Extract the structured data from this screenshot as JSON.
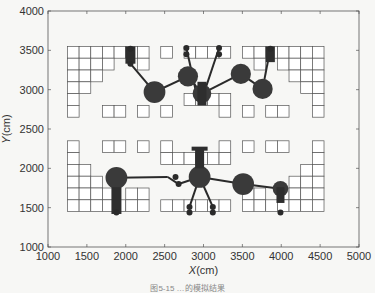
{
  "chart_data": {
    "type": "scatter",
    "title": "",
    "xlabel": "X(cm)",
    "ylabel": "Y(cm)",
    "xlim": [
      1000,
      5000
    ],
    "ylim": [
      1000,
      4000
    ],
    "xticks": [
      1000,
      1500,
      2000,
      2500,
      3000,
      3500,
      4000,
      4500,
      5000
    ],
    "yticks": [
      1000,
      1500,
      2000,
      2500,
      3000,
      3500,
      4000
    ],
    "grid": false,
    "legend": null,
    "cell_size_cm": 150,
    "cells_top": [
      [
        1250,
        3400
      ],
      [
        1400,
        3400
      ],
      [
        1550,
        3400
      ],
      [
        1700,
        3400
      ],
      [
        1850,
        3400
      ],
      [
        2000,
        3400
      ],
      [
        2150,
        3400
      ],
      [
        2450,
        3400
      ],
      [
        2750,
        3400
      ],
      [
        2900,
        3400
      ],
      [
        3050,
        3400
      ],
      [
        3200,
        3400
      ],
      [
        3500,
        3400
      ],
      [
        3650,
        3400
      ],
      [
        3800,
        3400
      ],
      [
        3950,
        3400
      ],
      [
        4100,
        3400
      ],
      [
        4250,
        3400
      ],
      [
        4400,
        3400
      ],
      [
        1250,
        3250
      ],
      [
        1400,
        3250
      ],
      [
        1550,
        3250
      ],
      [
        1700,
        3250
      ],
      [
        2150,
        3250
      ],
      [
        3650,
        3250
      ],
      [
        3950,
        3250
      ],
      [
        4100,
        3250
      ],
      [
        4250,
        3250
      ],
      [
        4400,
        3250
      ],
      [
        1250,
        3100
      ],
      [
        1400,
        3100
      ],
      [
        1550,
        3100
      ],
      [
        4100,
        3100
      ],
      [
        4250,
        3100
      ],
      [
        4400,
        3100
      ],
      [
        1250,
        2950
      ],
      [
        1400,
        2950
      ],
      [
        4250,
        2950
      ],
      [
        4400,
        2950
      ],
      [
        1250,
        2800
      ],
      [
        2750,
        2800
      ],
      [
        2900,
        2800
      ],
      [
        3050,
        2800
      ],
      [
        3200,
        2800
      ],
      [
        4400,
        2800
      ],
      [
        1250,
        2650
      ],
      [
        1700,
        2650
      ],
      [
        1850,
        2650
      ],
      [
        2150,
        2650
      ],
      [
        2450,
        2650
      ],
      [
        3200,
        2650
      ],
      [
        3500,
        2650
      ],
      [
        3800,
        2650
      ],
      [
        3950,
        2650
      ],
      [
        4400,
        2650
      ]
    ],
    "cells_bottom": [
      [
        1250,
        2200
      ],
      [
        1700,
        2200
      ],
      [
        1850,
        2200
      ],
      [
        2150,
        2200
      ],
      [
        2450,
        2200
      ],
      [
        3200,
        2200
      ],
      [
        3500,
        2200
      ],
      [
        3800,
        2200
      ],
      [
        3950,
        2200
      ],
      [
        4400,
        2200
      ],
      [
        1250,
        2050
      ],
      [
        2450,
        2050
      ],
      [
        2600,
        2050
      ],
      [
        2750,
        2050
      ],
      [
        2900,
        2050
      ],
      [
        3050,
        2050
      ],
      [
        3200,
        2050
      ],
      [
        4400,
        2050
      ],
      [
        1250,
        1900
      ],
      [
        1400,
        1900
      ],
      [
        4250,
        1900
      ],
      [
        4400,
        1900
      ],
      [
        1250,
        1750
      ],
      [
        1400,
        1750
      ],
      [
        1550,
        1750
      ],
      [
        4100,
        1750
      ],
      [
        4250,
        1750
      ],
      [
        4400,
        1750
      ],
      [
        1250,
        1600
      ],
      [
        1400,
        1600
      ],
      [
        1550,
        1600
      ],
      [
        1700,
        1600
      ],
      [
        2000,
        1600
      ],
      [
        2150,
        1600
      ],
      [
        3500,
        1600
      ],
      [
        3650,
        1600
      ],
      [
        3950,
        1600
      ],
      [
        4100,
        1600
      ],
      [
        4250,
        1600
      ],
      [
        4400,
        1600
      ],
      [
        1250,
        1450
      ],
      [
        1400,
        1450
      ],
      [
        1550,
        1450
      ],
      [
        1700,
        1450
      ],
      [
        1850,
        1450
      ],
      [
        2000,
        1450
      ],
      [
        2150,
        1450
      ],
      [
        2450,
        1450
      ],
      [
        2600,
        1450
      ],
      [
        2750,
        1450
      ],
      [
        2900,
        1450
      ],
      [
        3050,
        1450
      ],
      [
        3200,
        1450
      ],
      [
        3500,
        1450
      ],
      [
        3650,
        1450
      ],
      [
        3800,
        1450
      ],
      [
        3950,
        1450
      ],
      [
        4100,
        1450
      ],
      [
        4250,
        1450
      ],
      [
        4400,
        1450
      ]
    ],
    "nodes_top": [
      {
        "x": 2370,
        "y": 2970,
        "r": 140
      },
      {
        "x": 2800,
        "y": 3170,
        "r": 130
      },
      {
        "x": 3480,
        "y": 3200,
        "r": 130
      },
      {
        "x": 3760,
        "y": 3010,
        "r": 130
      },
      {
        "x": 2980,
        "y": 2950,
        "r": 120
      }
    ],
    "nodes_bottom": [
      {
        "x": 1880,
        "y": 1880,
        "r": 140
      },
      {
        "x": 2950,
        "y": 1890,
        "r": 140
      },
      {
        "x": 3510,
        "y": 1800,
        "r": 140
      },
      {
        "x": 3990,
        "y": 1740,
        "r": 100
      }
    ],
    "links_top": [
      [
        [
          2060,
          3330
        ],
        [
          2370,
          2970
        ]
      ],
      [
        [
          2370,
          2970
        ],
        [
          2800,
          3170
        ]
      ],
      [
        [
          2800,
          3170
        ],
        [
          2980,
          2950
        ]
      ],
      [
        [
          2780,
          3530
        ],
        [
          2920,
          2900
        ]
      ],
      [
        [
          3200,
          3530
        ],
        [
          2980,
          2880
        ]
      ],
      [
        [
          2980,
          2950
        ],
        [
          3480,
          3200
        ]
      ],
      [
        [
          3480,
          3200
        ],
        [
          3760,
          3010
        ]
      ],
      [
        [
          3860,
          3520
        ],
        [
          3760,
          3010
        ]
      ]
    ],
    "links_bottom": [
      [
        [
          1880,
          1880
        ],
        [
          2540,
          1890
        ]
      ],
      [
        [
          2540,
          1890
        ],
        [
          2680,
          1800
        ]
      ],
      [
        [
          2680,
          1800
        ],
        [
          2950,
          1890
        ]
      ],
      [
        [
          2950,
          1890
        ],
        [
          3510,
          1800
        ]
      ],
      [
        [
          3510,
          1800
        ],
        [
          3990,
          1740
        ]
      ],
      [
        [
          2950,
          1890
        ],
        [
          2820,
          1510
        ]
      ],
      [
        [
          2950,
          1890
        ],
        [
          3120,
          1510
        ]
      ],
      [
        [
          2950,
          1890
        ],
        [
          2950,
          2200
        ]
      ]
    ],
    "dots": [
      [
        2060,
        3520
      ],
      [
        2060,
        3330
      ],
      [
        2780,
        3530
      ],
      [
        2780,
        3450
      ],
      [
        3200,
        3530
      ],
      [
        3200,
        3450
      ],
      [
        3860,
        3520
      ],
      [
        2640,
        1890
      ],
      [
        2680,
        1800
      ],
      [
        2820,
        1510
      ],
      [
        2820,
        1440
      ],
      [
        3120,
        1510
      ],
      [
        3120,
        1440
      ],
      [
        3990,
        1440
      ],
      [
        1880,
        1440
      ]
    ]
  },
  "axes": {
    "xlabel_italic": "X",
    "xlabel_unit": "(cm)",
    "ylabel_italic": "Y",
    "ylabel_unit": "(cm)"
  },
  "caption": "图5-15 …的模拟结果"
}
